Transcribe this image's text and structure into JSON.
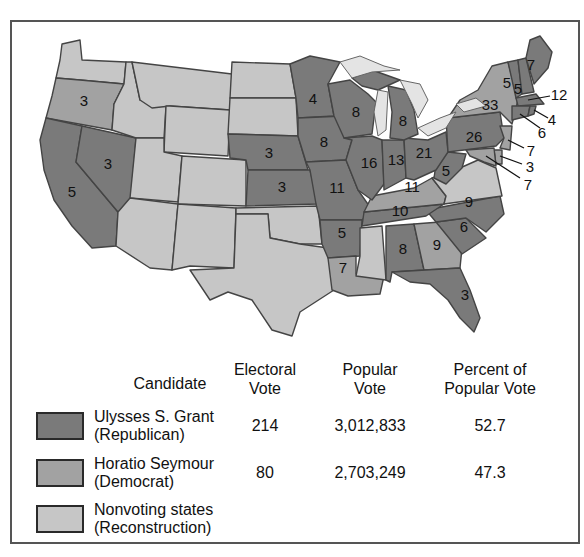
{
  "colors": {
    "republican": "#7a7a7a",
    "democrat": "#a2a2a2",
    "nonvoting": "#c6c6c6",
    "lakes": "#e4e4e4",
    "border": "#444444"
  },
  "map": {
    "state_labels": [
      {
        "state": "Oregon",
        "value": "3",
        "party": "democrat"
      },
      {
        "state": "California",
        "value": "5",
        "party": "republican"
      },
      {
        "state": "Nevada",
        "value": "3",
        "party": "republican"
      },
      {
        "state": "Nebraska",
        "value": "3",
        "party": "republican"
      },
      {
        "state": "Kansas",
        "value": "3",
        "party": "republican"
      },
      {
        "state": "Minnesota",
        "value": "4",
        "party": "republican"
      },
      {
        "state": "Iowa",
        "value": "8",
        "party": "republican"
      },
      {
        "state": "Missouri",
        "value": "11",
        "party": "republican"
      },
      {
        "state": "Wisconsin",
        "value": "8",
        "party": "republican"
      },
      {
        "state": "Illinois",
        "value": "16",
        "party": "republican"
      },
      {
        "state": "Michigan",
        "value": "8",
        "party": "republican"
      },
      {
        "state": "Indiana",
        "value": "13",
        "party": "republican"
      },
      {
        "state": "Ohio",
        "value": "21",
        "party": "republican"
      },
      {
        "state": "Pennsylvania",
        "value": "26",
        "party": "republican"
      },
      {
        "state": "New York",
        "value": "33",
        "party": "democrat"
      },
      {
        "state": "Vermont",
        "value": "5",
        "party": "republican"
      },
      {
        "state": "New Hampshire",
        "value": "5",
        "party": "republican"
      },
      {
        "state": "Maine",
        "value": "7",
        "party": "republican"
      },
      {
        "state": "Massachusetts",
        "value": "12",
        "party": "republican"
      },
      {
        "state": "Rhode Island",
        "value": "4",
        "party": "republican"
      },
      {
        "state": "Connecticut",
        "value": "6",
        "party": "republican"
      },
      {
        "state": "New Jersey",
        "value": "7",
        "party": "democrat"
      },
      {
        "state": "Delaware",
        "value": "3",
        "party": "democrat"
      },
      {
        "state": "Maryland",
        "value": "7",
        "party": "democrat"
      },
      {
        "state": "West Virginia",
        "value": "5",
        "party": "republican"
      },
      {
        "state": "Kentucky",
        "value": "11",
        "party": "democrat"
      },
      {
        "state": "Tennessee",
        "value": "10",
        "party": "republican"
      },
      {
        "state": "North Carolina",
        "value": "9",
        "party": "republican"
      },
      {
        "state": "South Carolina",
        "value": "6",
        "party": "republican"
      },
      {
        "state": "Georgia",
        "value": "9",
        "party": "democrat"
      },
      {
        "state": "Alabama",
        "value": "8",
        "party": "republican"
      },
      {
        "state": "Arkansas",
        "value": "5",
        "party": "republican"
      },
      {
        "state": "Louisiana",
        "value": "7",
        "party": "democrat"
      },
      {
        "state": "Florida",
        "value": "3",
        "party": "republican"
      }
    ]
  },
  "table": {
    "headers": {
      "candidate": "Candidate",
      "electoral_1": "Electoral",
      "electoral_2": "Vote",
      "popular_1": "Popular",
      "popular_2": "Vote",
      "percent_1": "Percent of",
      "percent_2": "Popular Vote"
    },
    "rows": [
      {
        "name": "Ulysses S. Grant",
        "party": "(Republican)",
        "electoral": "214",
        "popular": "3,012,833",
        "percent": "52.7"
      },
      {
        "name": "Horatio Seymour",
        "party": "(Democrat)",
        "electoral": "80",
        "popular": "2,703,249",
        "percent": "47.3"
      },
      {
        "name": "Nonvoting states",
        "party": "(Reconstruction)",
        "electoral": "",
        "popular": "",
        "percent": ""
      }
    ]
  }
}
